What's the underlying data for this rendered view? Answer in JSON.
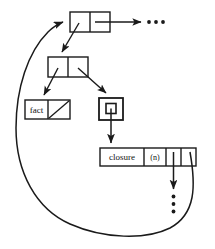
{
  "diagram": {
    "stroke_color": "#1a1a1a",
    "fill_color": "#ffffff",
    "background": "#ffffff",
    "nodes": {
      "env_cons_top": {
        "kind": "cons-cell",
        "cells": [
          "",
          ""
        ],
        "x": 70,
        "y": 12,
        "w": 40,
        "h": 20
      },
      "env_cons_second": {
        "kind": "cons-cell",
        "cells": [
          "",
          ""
        ],
        "x": 48,
        "y": 57,
        "w": 40,
        "h": 20
      },
      "binding_pair": {
        "kind": "cons-cell",
        "cells": [
          "fact",
          ""
        ],
        "label": "fact",
        "nil_slash": true,
        "x": 25,
        "y": 100,
        "w": 45,
        "h": 19
      },
      "boxed_pointer": {
        "kind": "nested-box",
        "outer": {
          "x": 99,
          "y": 98,
          "w": 24,
          "h": 22
        },
        "inner": {
          "x": 106,
          "y": 103,
          "w": 10,
          "h": 10
        }
      },
      "closure_record": {
        "kind": "record",
        "cells": [
          "closure",
          "(n)",
          "",
          ""
        ],
        "x": 100,
        "y": 148,
        "w": 96,
        "h": 18,
        "cell_widths": [
          44,
          22,
          15,
          15
        ]
      }
    },
    "ellipses": {
      "top_right": {
        "glyph": "•••",
        "orientation": "horizontal",
        "count": 3,
        "x": 155,
        "y": 22
      },
      "bottom_right": {
        "glyph": "•",
        "orientation": "vertical",
        "count": 3,
        "x": 172,
        "y": 205
      }
    },
    "labels": {
      "fact": "fact",
      "closure": "closure",
      "params": "(n)"
    },
    "edges": [
      {
        "name": "top-cdr-to-rest",
        "from": "env_cons_top.cdr",
        "to": "top_right_ellipsis",
        "style": "straight-arrow"
      },
      {
        "name": "top-car-to-frame",
        "from": "env_cons_top.car",
        "to": "env_cons_second",
        "style": "straight-arrow"
      },
      {
        "name": "frame-car-to-binding",
        "from": "env_cons_second.car",
        "to": "binding_pair",
        "style": "straight-arrow"
      },
      {
        "name": "frame-cdr-to-boxed",
        "from": "env_cons_second.cdr",
        "to": "boxed_pointer",
        "style": "straight-arrow"
      },
      {
        "name": "boxed-to-closure",
        "from": "boxed_pointer",
        "to": "closure_record",
        "style": "straight-arrow"
      },
      {
        "name": "closure-slot3-to-ellipsis",
        "from": "closure_record.cell3",
        "to": "bottom_right_ellipsis",
        "style": "straight-arrow"
      },
      {
        "name": "closure-env-back-to-top",
        "from": "closure_record.cell4",
        "to": "env_cons_top",
        "style": "curved-arrow"
      }
    ]
  }
}
